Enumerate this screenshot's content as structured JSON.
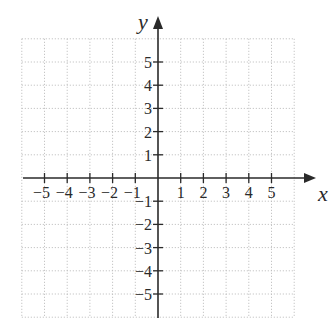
{
  "chart_data": {
    "type": "coordinate-plane",
    "title": "",
    "xlabel": "x",
    "ylabel": "y",
    "xlim": [
      -6,
      6
    ],
    "ylim": [
      -6,
      6
    ],
    "grid": true,
    "grid_style": "dotted",
    "x_ticks": [
      -5,
      -4,
      -3,
      -2,
      -1,
      1,
      2,
      3,
      4,
      5
    ],
    "y_ticks": [
      -5,
      -4,
      -3,
      -2,
      -1,
      1,
      2,
      3,
      4,
      5
    ],
    "x_tick_labels": [
      "−5",
      "−4",
      "−3",
      "−2",
      "−1",
      "1",
      "2",
      "3",
      "4",
      "5"
    ],
    "y_tick_labels": [
      "−5",
      "−4",
      "−3",
      "−2",
      "−1",
      "1",
      "2",
      "3",
      "4",
      "5"
    ],
    "series": []
  },
  "labels": {
    "x_axis": "x",
    "y_axis": "y"
  },
  "colors": {
    "axis": "#2a2a2a",
    "grid": "#b8b8b8",
    "background": "#ffffff"
  }
}
